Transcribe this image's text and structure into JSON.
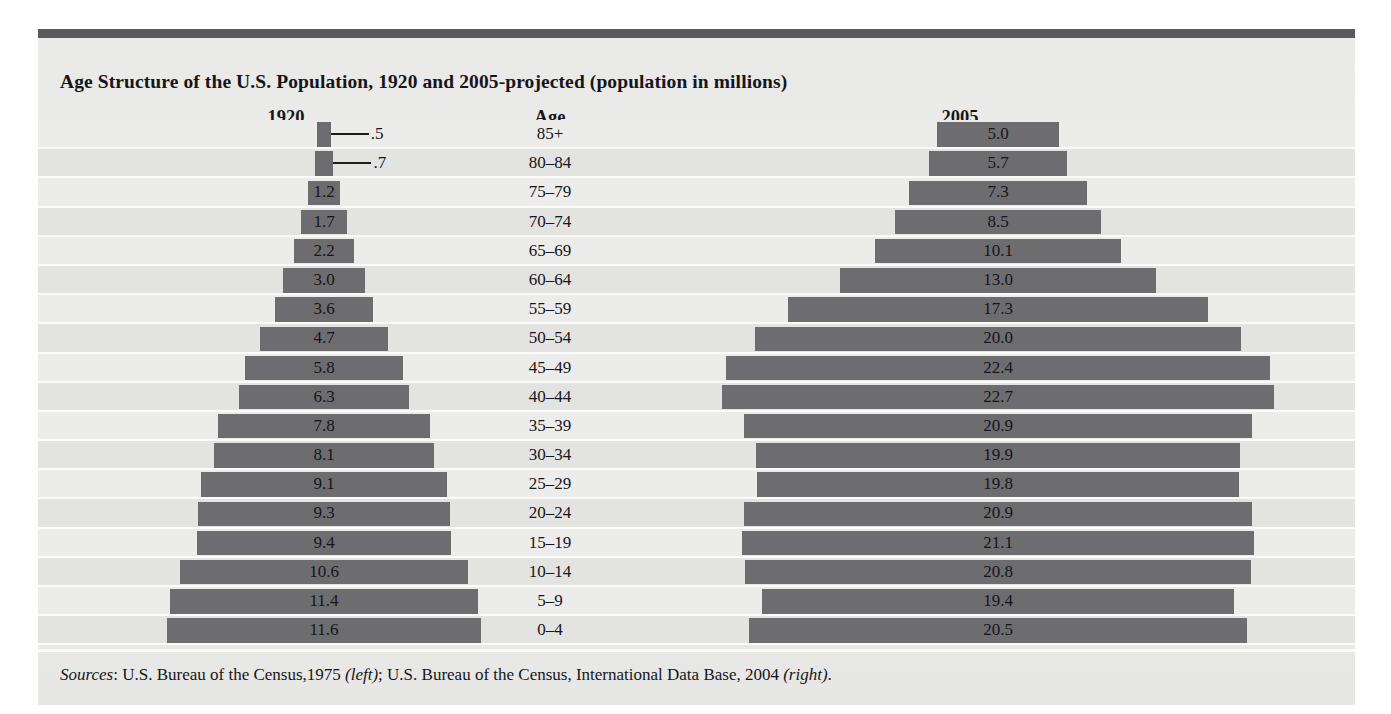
{
  "figure": {
    "title": "Age Structure of the U.S. Population, 1920 and 2005-projected (population in millions)",
    "source_label": "Sources",
    "source_sep1": ": U.S. Bureau of the Census,1975 ",
    "source_left_tag": "(left)",
    "source_sep2": "; U.S. Bureau of the Census, International Data Base, 2004 ",
    "source_right_tag": "(right)",
    "source_end": ".",
    "bar_color": "#6d6d6f",
    "panel_bar_color": "#5a5a5c",
    "row_color_odd": "#e3e3e1",
    "row_color_even": "#ececea"
  },
  "columns": {
    "left_header": "1920",
    "age_header": "Age",
    "right_header": "2005"
  },
  "chart_data": {
    "type": "bar",
    "title": "Age Structure of the U.S. Population, 1920 and 2005-projected (population in millions)",
    "subtype": "population-pyramid",
    "orientation": "horizontal",
    "xlabel": "Population (millions)",
    "ylabel": "Age",
    "grid": false,
    "legend_position": "column-headers",
    "categories": [
      "85+",
      "80-84",
      "75-79",
      "70-74",
      "65-69",
      "60-64",
      "55-59",
      "50-54",
      "45-49",
      "40-44",
      "35-39",
      "30-34",
      "25-29",
      "20-24",
      "15-19",
      "10-14",
      "5-9",
      "0-4"
    ],
    "series": [
      {
        "name": "1920",
        "side": "left",
        "values": [
          0.5,
          0.7,
          1.2,
          1.7,
          2.2,
          3.0,
          3.6,
          4.7,
          5.8,
          6.3,
          7.8,
          8.1,
          9.1,
          9.3,
          9.4,
          10.6,
          11.4,
          11.6
        ],
        "labels": [
          ".5",
          ".7",
          "1.2",
          "1.7",
          "2.2",
          "3.0",
          "3.6",
          "4.7",
          "5.8",
          "6.3",
          "7.8",
          "8.1",
          "9.1",
          "9.3",
          "9.4",
          "10.6",
          "11.4",
          "11.6"
        ],
        "label_outside": [
          true,
          true,
          false,
          false,
          false,
          false,
          false,
          false,
          false,
          false,
          false,
          false,
          false,
          false,
          false,
          false,
          false,
          false
        ]
      },
      {
        "name": "2005",
        "side": "right",
        "values": [
          5.0,
          5.7,
          7.3,
          8.5,
          10.1,
          13.0,
          17.3,
          20.0,
          22.4,
          22.7,
          20.9,
          19.9,
          19.8,
          20.9,
          21.1,
          20.8,
          19.4,
          20.5
        ],
        "labels": [
          "5.0",
          "5.7",
          "7.3",
          "8.5",
          "10.1",
          "13.0",
          "17.3",
          "20.0",
          "22.4",
          "22.7",
          "20.9",
          "19.9",
          "19.8",
          "20.9",
          "21.1",
          "20.8",
          "19.4",
          "20.5"
        ],
        "label_outside": [
          false,
          false,
          false,
          false,
          false,
          false,
          false,
          false,
          false,
          false,
          false,
          false,
          false,
          false,
          false,
          false,
          false,
          false
        ]
      }
    ],
    "xlim_left": [
      0,
      12
    ],
    "xlim_right": [
      0,
      23
    ]
  },
  "geometry": {
    "left_center_x": 286,
    "right_center_x": 960,
    "left_px_per_unit": 27.1,
    "right_px_per_unit": 24.3,
    "min_bar_px": 13
  }
}
